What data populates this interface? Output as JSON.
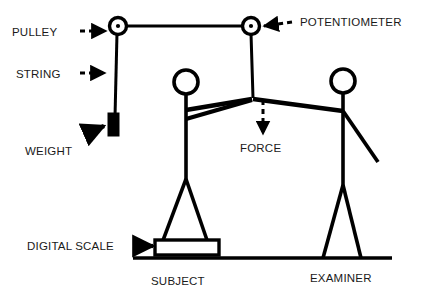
{
  "figure": {
    "type": "schematic-diagram",
    "background_color": "#ffffff",
    "ink_color": "#000000",
    "text_color": "#1a1a1a"
  },
  "labels": {
    "pulley": "PULLEY",
    "string": "STRING",
    "weight": "WEIGHT",
    "potentiometer": "POTENTIOMETER",
    "force": "FORCE",
    "digital_scale": "DIGITAL SCALE",
    "subject": "SUBJECT",
    "examiner": "EXAMINER"
  },
  "annotations": [
    {
      "name": "pulley",
      "label": "PULLEY",
      "arrow": "dashed-right",
      "points_to": "left-pulley"
    },
    {
      "name": "string",
      "label": "STRING",
      "arrow": "dashed-right",
      "points_to": "vertical-string"
    },
    {
      "name": "weight",
      "label": "WEIGHT",
      "arrow": "solid-up-right",
      "points_to": "weight-block"
    },
    {
      "name": "potentiometer",
      "label": "POTENTIOMETER",
      "arrow": "dashed-left",
      "points_to": "right-pulley"
    },
    {
      "name": "force",
      "label": "FORCE",
      "arrow": "dashed-down",
      "points_to": "arm-junction"
    },
    {
      "name": "digital-scale",
      "label": "DIGITAL SCALE",
      "arrow": "solid-right",
      "points_to": "scale-platform"
    }
  ],
  "figures": [
    {
      "name": "subject",
      "label": "SUBJECT",
      "stands_on": "digital-scale"
    },
    {
      "name": "examiner",
      "label": "EXAMINER",
      "stands_on": "ground"
    }
  ],
  "components": [
    {
      "name": "left-pulley",
      "shape": "circle-with-hub"
    },
    {
      "name": "right-pulley",
      "shape": "circle-with-hub"
    },
    {
      "name": "top-string",
      "shape": "horizontal-line"
    },
    {
      "name": "vertical-string",
      "shape": "vertical-line"
    },
    {
      "name": "weight-block",
      "shape": "filled-rectangle"
    },
    {
      "name": "scale-platform",
      "shape": "hollow-rectangle"
    },
    {
      "name": "ground-line",
      "shape": "horizontal-line"
    }
  ]
}
